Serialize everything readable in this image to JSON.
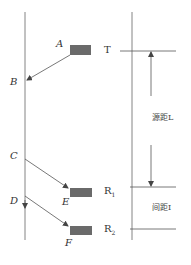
{
  "diagram": {
    "points": {
      "A": "A",
      "B": "B",
      "C": "C",
      "D": "D",
      "E": "E",
      "F": "F"
    },
    "transducers": {
      "transmitter": "T",
      "receiver1": "R",
      "receiver1_sub": "1",
      "receiver2": "R",
      "receiver2_sub": "2"
    },
    "dimensions": {
      "source_distance": "源距L",
      "spacing": "间距I"
    },
    "colors": {
      "line": "#555555",
      "transducer_fill": "#6a6a6a",
      "background": "#ffffff"
    },
    "ray_paths": [
      {
        "from": "A",
        "to": "B"
      },
      {
        "from": "C",
        "to": "E"
      },
      {
        "from": "D",
        "to": "F"
      }
    ]
  }
}
